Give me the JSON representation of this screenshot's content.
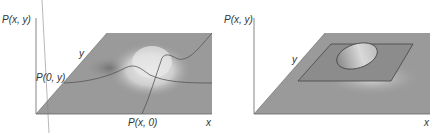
{
  "left_panel": {
    "z_axis_label": "P(x, y)",
    "y_axis_label": "y",
    "x_axis_label": "x",
    "marginal_y_label": "P(0, y)",
    "marginal_x_label": "P(x, 0)"
  },
  "right_panel": {
    "z_axis_label": "P(x, y)",
    "y_axis_label": "y",
    "x_axis_label": "x"
  },
  "colors": {
    "plane": "#9a9a9a",
    "plane_dark": "#7d7d7d",
    "highlight": "#e6e6e6",
    "line": "#555555",
    "axis": "#666666"
  }
}
